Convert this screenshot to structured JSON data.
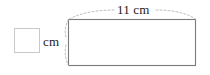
{
  "figure": {
    "type": "geometry-diagram",
    "shape": "rectangle",
    "background_color": "#ffffff",
    "stroke_color": "#7a7a7a",
    "leader_color": "#b0b0b0",
    "text_color": "#222222",
    "rectangle": {
      "x": 68,
      "y": 19,
      "width": 128,
      "height": 47,
      "fill": "#ffffff"
    },
    "width_label": {
      "text": "11 cm",
      "value": "11",
      "unit": "cm"
    },
    "height_label": {
      "unit": "cm",
      "value": "",
      "placeholder": ""
    },
    "answer_box": {
      "value": "",
      "border_color": "#c9c9c9",
      "fill": "#ffffff"
    }
  }
}
